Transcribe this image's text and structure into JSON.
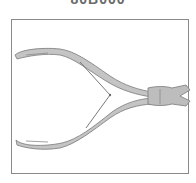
{
  "product": {
    "code": "80B000",
    "image_alt": "nail nipper / cutting pliers illustration"
  },
  "colors": {
    "frame_border": "#8a8a8a",
    "tool_fill": "#c4c4c4",
    "tool_stroke": "#7a7a7a",
    "code_text": "#6a6a6a"
  }
}
